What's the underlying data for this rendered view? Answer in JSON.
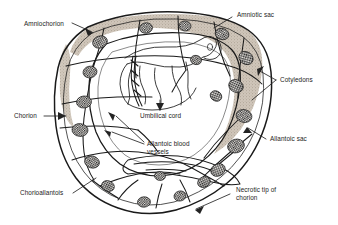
{
  "figure": {
    "name": "fetal-membranes-placenta-diagram",
    "style": "black-and-white line drawing",
    "background_color": "#ffffff",
    "ink_color": "#1a1a1a",
    "membrane_shade_color": "#b8ada0",
    "cotyledon_color": "#2b2b2b"
  },
  "labels": {
    "amniochorion": "Amniochorion",
    "amniotic_sac": "Amniotic sac",
    "cotyledons": "Cotyledons",
    "chorion": "Chorion",
    "allantoic_sac": "Allantoic sac",
    "umbilical_cord": "Umbilical cord",
    "allantoic_blood_vessels_line1": "Allantoic blood",
    "allantoic_blood_vessels_line2": "vessels",
    "chorioallantois": "Chorioallantois",
    "necrotic_tip_line1": "Necrotic tip of",
    "necrotic_tip_line2": "chorion"
  }
}
